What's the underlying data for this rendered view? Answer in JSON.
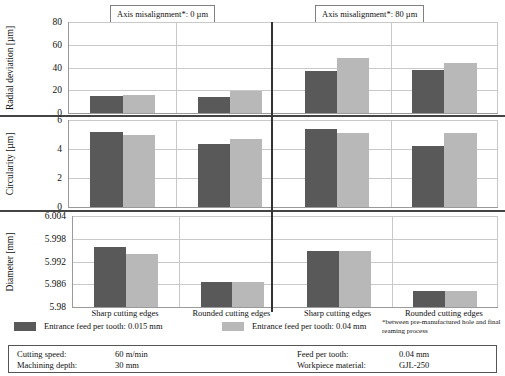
{
  "chart_data": {
    "type": "bar",
    "title": "",
    "orientation": "grouped-vertical",
    "panel_headers": [
      {
        "label": "Axis misalignment*: 0 µm"
      },
      {
        "label": "Axis misalignment*: 80 µm"
      }
    ],
    "categories": [
      "Sharp cutting edges",
      "Rounded cutting edges",
      "Sharp cutting edges",
      "Rounded cutting edges"
    ],
    "series": [
      {
        "name": "Entrance feed per tooth: 0.015 mm",
        "color": "#595959"
      },
      {
        "name": "Entrance feed per tooth: 0.04 mm",
        "color": "#b8b8b8"
      }
    ],
    "legend_position": "bottom",
    "grid": true,
    "panels": [
      {
        "id": "radial-deviation",
        "ylabel": "Radial deviation [µm]",
        "yunit": "µm",
        "ylim": [
          0,
          80
        ],
        "yticks": [
          0,
          20,
          40,
          60,
          80
        ],
        "ytick_labels": [
          "0",
          "20",
          "40",
          "60",
          "80"
        ],
        "series_values": [
          [
            15,
            14,
            37,
            38
          ],
          [
            16,
            19,
            48,
            44
          ]
        ]
      },
      {
        "id": "circularity",
        "ylabel": "Circularity [µm]",
        "yunit": "µm",
        "ylim": [
          0,
          6
        ],
        "yticks": [
          0,
          2,
          4,
          6
        ],
        "ytick_labels": [
          "0",
          "2",
          "4",
          "6"
        ],
        "series_values": [
          [
            5.15,
            4.35,
            5.35,
            4.2
          ],
          [
            4.95,
            4.7,
            5.1,
            5.1
          ]
        ]
      },
      {
        "id": "diameter",
        "ylabel": "Diameter [mm]",
        "yunit": "mm",
        "ylim": [
          5.98,
          6.004
        ],
        "yticks": [
          5.98,
          5.986,
          5.992,
          5.998,
          6.004
        ],
        "ytick_labels": [
          "5.98",
          "5.986",
          "5.992",
          "5.998",
          "6.004"
        ],
        "series_values": [
          [
            5.9957,
            5.9867,
            5.9948,
            5.9843
          ],
          [
            5.9941,
            5.9865,
            5.9948,
            5.9843
          ]
        ]
      }
    ],
    "footnote": "*between pre-manufactured hole and final reaming process",
    "parameters": [
      {
        "label": "Cutting speed:",
        "value": "60 m/min"
      },
      {
        "label": "Machining depth:",
        "value": "30 mm"
      },
      {
        "label": "Feed per tooth:",
        "value": "0.04 mm"
      },
      {
        "label": "Workpiece material:",
        "value": "GJL-250"
      }
    ],
    "colors": {
      "series_dark": "#595959",
      "series_light": "#b8b8b8",
      "grid": "#c9c9c9",
      "axis": "#9a9a9a",
      "divider": "#333333"
    }
  }
}
